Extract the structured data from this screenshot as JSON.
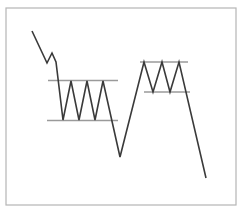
{
  "chart_data": {
    "type": "line",
    "title": "",
    "subtitle": "",
    "xlabel": "",
    "ylabel": "",
    "grid": false,
    "legend": null,
    "axis_visible": false,
    "xlim": [
      0,
      243
    ],
    "ylim": [
      212,
      0
    ],
    "series": [
      {
        "name": "price-line",
        "color": "#3a3a3a",
        "width": 1.6,
        "points": [
          [
            32,
            31
          ],
          [
            47,
            63
          ],
          [
            52,
            53
          ],
          [
            56,
            62
          ],
          [
            63,
            120
          ],
          [
            71,
            81
          ],
          [
            79,
            120
          ],
          [
            87,
            81
          ],
          [
            95,
            120
          ],
          [
            103,
            81
          ],
          [
            120,
            157
          ],
          [
            144,
            62
          ],
          [
            153,
            92
          ],
          [
            162,
            62
          ],
          [
            170,
            92
          ],
          [
            179,
            62
          ],
          [
            206,
            178
          ]
        ]
      }
    ],
    "annotations": [
      {
        "name": "left-rectangle-resistance",
        "type": "hline",
        "label": "resistance",
        "y": 80.5,
        "x_start": 48,
        "x_end": 118,
        "color": "#9a9a9a",
        "width": 1.3
      },
      {
        "name": "left-rectangle-support",
        "type": "hline",
        "label": "support",
        "y": 120.5,
        "x_start": 47,
        "x_end": 118,
        "color": "#9a9a9a",
        "width": 1.3
      },
      {
        "name": "right-rectangle-resistance",
        "type": "hline",
        "label": "resistance",
        "y": 62.0,
        "x_start": 140,
        "x_end": 188,
        "color": "#9a9a9a",
        "width": 1.3
      },
      {
        "name": "right-rectangle-support",
        "type": "hline",
        "label": "support",
        "y": 92.0,
        "x_start": 144,
        "x_end": 190,
        "color": "#9a9a9a",
        "width": 1.3
      }
    ],
    "frame": {
      "x": 6,
      "y": 8,
      "width": 230,
      "height": 197,
      "color": "#b5b5b5",
      "width_px": 1.2
    },
    "background_color": "#ffffff"
  }
}
